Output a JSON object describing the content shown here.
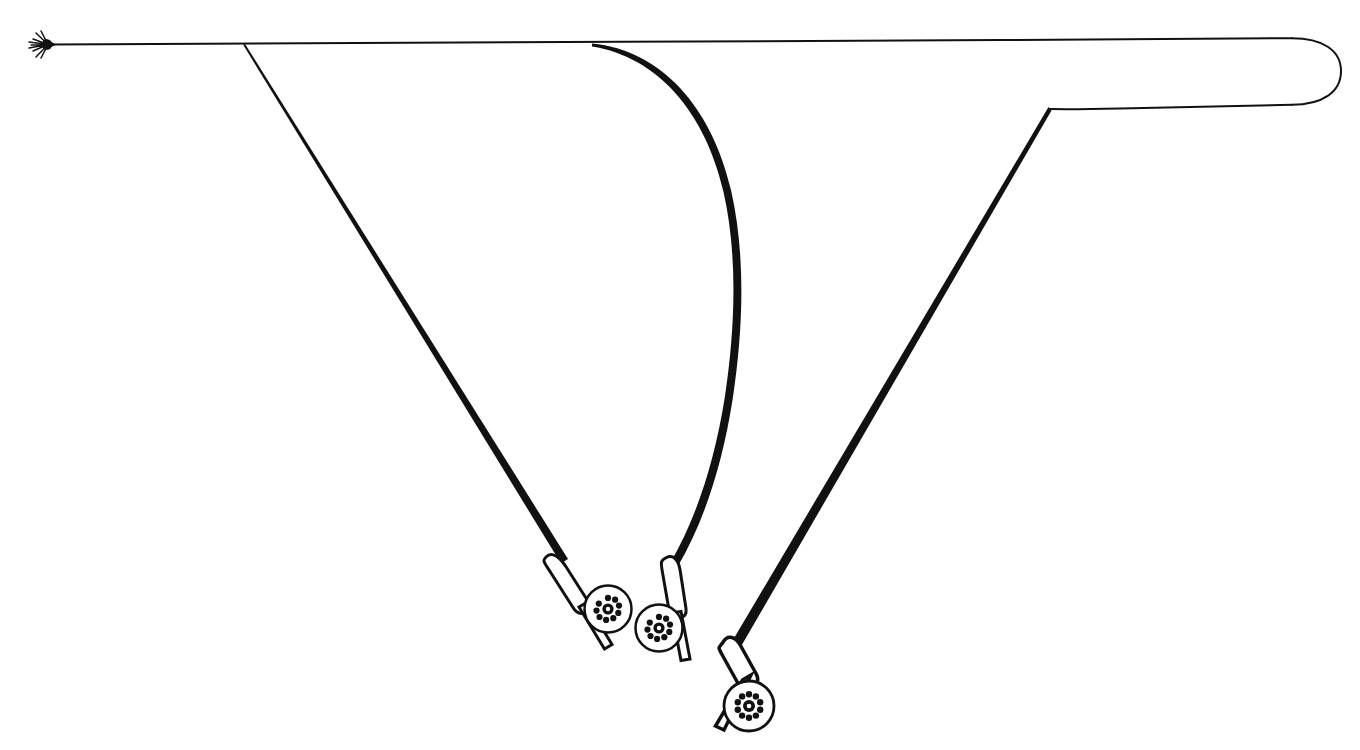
{
  "figure": {
    "background_color": "#ffffff",
    "ink_color": "#111111",
    "canvas": {
      "width": 1360,
      "height": 750
    }
  },
  "elements": {
    "fly": {
      "name": "artificial fly",
      "x": 42,
      "y": 44,
      "label": ""
    },
    "line": {
      "name": "fly line",
      "upper_leg_label": "",
      "lower_leg_label": "",
      "loop_tip_label": "",
      "upper_leg_y_left": 44,
      "upper_leg_y_right": 38,
      "lower_leg_y_left": 110,
      "lower_leg_y_right": 104,
      "loop_tip_x": 1340
    },
    "rods": [
      {
        "id": "rod-1",
        "name": "rod position one",
        "label": "",
        "style": "thin straight",
        "tip": {
          "x": 243,
          "y": 45
        },
        "butt": {
          "x": 607,
          "y": 641
        },
        "stroke_width_tip": 2.2,
        "stroke_width_butt": 6.5
      },
      {
        "id": "rod-2",
        "name": "rod position two",
        "label": "",
        "style": "flexed curved",
        "tip": {
          "x": 592,
          "y": 44
        },
        "butt": {
          "x": 666,
          "y": 650
        },
        "stroke_width_tip": 2.4,
        "stroke_width_butt": 6.5
      },
      {
        "id": "rod-3",
        "name": "rod position three",
        "label": "",
        "style": "thick straight",
        "tip": {
          "x": 1048,
          "y": 108
        },
        "butt": {
          "x": 731,
          "y": 700
        },
        "stroke_width_tip": 3.0,
        "stroke_width_butt": 9.0
      }
    ],
    "reels": [
      {
        "id": "reel-1",
        "name": "fly reel on rod one",
        "cx": 608,
        "cy": 609,
        "r": 23,
        "hole_count": 9,
        "label": ""
      },
      {
        "id": "reel-2",
        "name": "fly reel on rod two",
        "cx": 659,
        "cy": 628,
        "r": 23,
        "hole_count": 9,
        "label": ""
      },
      {
        "id": "reel-3",
        "name": "fly reel on rod three",
        "cx": 731,
        "cy": 707,
        "r": 24,
        "hole_count": 10,
        "label": ""
      }
    ],
    "grips": [
      {
        "id": "grip-1",
        "name": "cork grip rod one",
        "label": ""
      },
      {
        "id": "grip-2",
        "name": "cork grip rod two",
        "label": ""
      },
      {
        "id": "grip-3",
        "name": "cork grip rod three",
        "label": ""
      }
    ]
  },
  "annotations": {
    "captions": [],
    "numbers": [],
    "notes": []
  }
}
